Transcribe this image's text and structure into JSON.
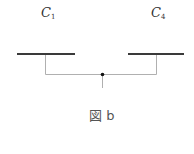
{
  "labels": {
    "left": {
      "main": "C",
      "sub": "1"
    },
    "right": {
      "main": "C",
      "sub": "4"
    }
  },
  "caption": "図 b",
  "colors": {
    "bar": "#3a3a3a",
    "connector": "#b0b0b0",
    "junction": "#111111"
  }
}
